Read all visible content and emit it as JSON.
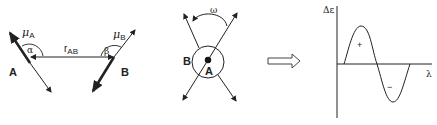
{
  "panel_dipoles": {
    "label_A": "A",
    "label_B": "B",
    "mu_A": "μ",
    "mu_A_sub": "A",
    "mu_B": "μ",
    "mu_B_sub": "B",
    "alpha": "α",
    "beta": "β",
    "r": "r",
    "r_sub": "AB"
  },
  "panel_stacked": {
    "label_A": "A",
    "label_B": "B",
    "omega": "ω"
  },
  "implies_arrow": "hollow-right-arrow",
  "panel_spectrum": {
    "y_label": "Δε",
    "x_label": "λ",
    "positive_band": "+",
    "negative_band": "−"
  },
  "colors": {
    "ink": "#222222",
    "background": "#ffffff"
  }
}
